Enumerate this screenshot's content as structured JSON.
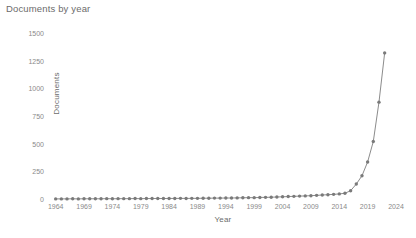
{
  "chart_data": {
    "type": "line",
    "title": "Documents by year",
    "xlabel": "Year",
    "ylabel": "Documents",
    "grid": false,
    "legend": "none",
    "marker": "circle",
    "line_color": "#8c8c8c",
    "marker_color": "#7a7a7a",
    "xlim": [
      1963,
      2024
    ],
    "ylim": [
      0,
      1500
    ],
    "ytick_values": [
      0,
      250,
      500,
      750,
      1000,
      1250,
      1500
    ],
    "ytick_labels": [
      "0",
      "250",
      "500",
      "750",
      "1000",
      "1250",
      "1500"
    ],
    "xtick_values": [
      1964,
      1969,
      1974,
      1979,
      1984,
      1989,
      1994,
      1999,
      2004,
      2009,
      2014,
      2019,
      2024
    ],
    "xtick_labels": [
      "1964",
      "1969",
      "1974",
      "1979",
      "1984",
      "1989",
      "1994",
      "1999",
      "2004",
      "2009",
      "2014",
      "2019",
      "2024"
    ],
    "x": [
      1964,
      1965,
      1966,
      1967,
      1968,
      1969,
      1970,
      1971,
      1972,
      1973,
      1974,
      1975,
      1976,
      1977,
      1978,
      1979,
      1980,
      1981,
      1982,
      1983,
      1984,
      1985,
      1986,
      1987,
      1988,
      1989,
      1990,
      1991,
      1992,
      1993,
      1994,
      1995,
      1996,
      1997,
      1998,
      1999,
      2000,
      2001,
      2002,
      2003,
      2004,
      2005,
      2006,
      2007,
      2008,
      2009,
      2010,
      2011,
      2012,
      2013,
      2014,
      2015,
      2016,
      2017,
      2018,
      2019,
      2020,
      2021,
      2022
    ],
    "values": [
      1,
      1,
      1,
      2,
      1,
      2,
      2,
      2,
      2,
      3,
      2,
      3,
      3,
      3,
      4,
      3,
      4,
      4,
      5,
      4,
      5,
      5,
      6,
      5,
      6,
      6,
      7,
      7,
      8,
      8,
      9,
      9,
      10,
      11,
      12,
      12,
      14,
      15,
      16,
      18,
      20,
      22,
      24,
      26,
      28,
      30,
      33,
      36,
      39,
      42,
      46,
      52,
      75,
      135,
      210,
      335,
      520,
      875,
      1320
    ],
    "series_name": "Documents"
  },
  "title": "Documents by year"
}
